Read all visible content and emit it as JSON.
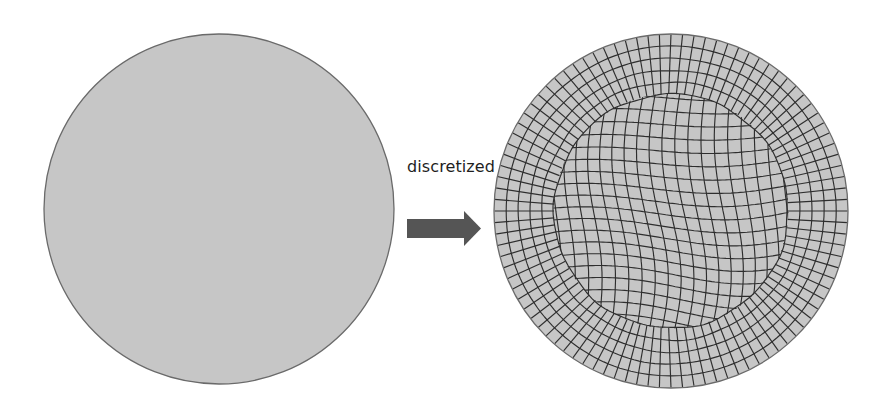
{
  "figure": {
    "caption_label": "discretized",
    "colors": {
      "background": "#ffffff",
      "domain_fill": "#c6c6c6",
      "domain_stroke": "#6a6a6a",
      "mesh_line": "#2e2e2e",
      "arrow": "#555555",
      "text": "#1e1e1e"
    },
    "left_shape": {
      "name": "continuous-domain",
      "type": "circle",
      "cx": 219,
      "cy": 209,
      "r": 175
    },
    "arrow": {
      "direction": "right",
      "shaft": [
        407,
        219,
        464,
        238
      ],
      "head": [
        [
          464,
          211
        ],
        [
          481,
          228.5
        ],
        [
          464,
          246
        ]
      ]
    },
    "right_shape": {
      "name": "discretized-mesh",
      "type": "circle",
      "cx": 671,
      "cy": 211,
      "r": 177,
      "mesh": {
        "element_type": "quadrilateral",
        "boundary_rings": 5,
        "boundary_spokes": 96,
        "approx_cell_size_px": 12
      }
    }
  }
}
